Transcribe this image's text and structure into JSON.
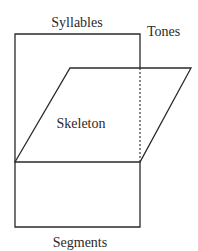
{
  "diagram": {
    "type": "three-dimensional phonological tier diagram",
    "labels": {
      "syllables": "Syllables",
      "tones": "Tones",
      "skeleton": "Skeleton",
      "segments": "Segments"
    },
    "planes": [
      {
        "name": "Syllables",
        "shape": "vertical rectangle (upper)",
        "corners": [
          [
            15,
            34
          ],
          [
            140,
            34
          ],
          [
            140,
            162
          ],
          [
            15,
            162
          ]
        ]
      },
      {
        "name": "Skeleton",
        "shape": "parallelogram (horizontal plane seen in perspective)",
        "corners": [
          [
            15,
            162
          ],
          [
            70,
            68
          ],
          [
            191,
            68
          ],
          [
            140,
            162
          ]
        ]
      },
      {
        "name": "Tones",
        "shape": "hidden edge of Syllables plane behind Skeleton (dashed)",
        "corners": [
          [
            140,
            68
          ],
          [
            140,
            162
          ]
        ]
      },
      {
        "name": "Segments",
        "shape": "vertical rectangle (lower)",
        "corners": [
          [
            15,
            162
          ],
          [
            140,
            162
          ],
          [
            140,
            227
          ],
          [
            15,
            227
          ]
        ]
      }
    ],
    "colors": {
      "line": "#2a2a2a",
      "background": "#ffffff"
    }
  }
}
